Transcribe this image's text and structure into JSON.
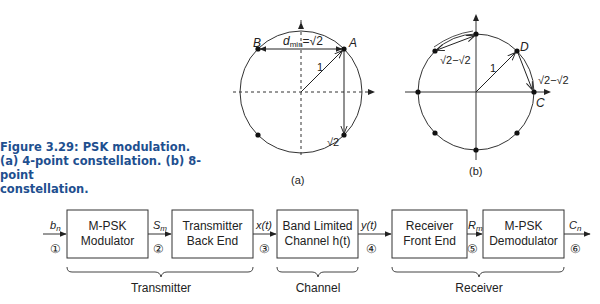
{
  "caption": {
    "line1": "Figure 3.29:  PSK modulation.",
    "line2": "(a) 4-point constellation. (b) 8-point",
    "line3": "constellation."
  },
  "constellation_a": {
    "label": "(a)",
    "points": [
      "A",
      "B"
    ],
    "dmin_label": "d",
    "dmin_sub": "min",
    "dmin_value": "=√2",
    "radius_label": "1",
    "vertical_distance_label": "√2"
  },
  "constellation_b": {
    "label": "(b)",
    "points": [
      "C",
      "D"
    ],
    "radius_label": "1",
    "distance_label_upper": "√2−√2",
    "distance_label_right": "√2−√2"
  },
  "block_diagram": {
    "blocks": [
      {
        "line1": "M-PSK",
        "line2": "Modulator"
      },
      {
        "line1": "Transmitter",
        "line2": "Back End"
      },
      {
        "line1": "Band Limited",
        "line2": "Channel h(t)"
      },
      {
        "line1": "Receiver",
        "line2": "Front End"
      },
      {
        "line1": "M-PSK",
        "line2": "Demodulator"
      }
    ],
    "signals": [
      {
        "name": "b",
        "sub": "n"
      },
      {
        "name": "S",
        "sub": "m"
      },
      {
        "name": "x(t)",
        "sub": ""
      },
      {
        "name": "y(t)",
        "sub": ""
      },
      {
        "name": "R",
        "sub": "m"
      },
      {
        "name": "C",
        "sub": "n"
      }
    ],
    "nodes": [
      "①",
      "②",
      "③",
      "④",
      "⑤",
      "⑥"
    ],
    "groups": [
      "Transmitter",
      "Channel",
      "Receiver"
    ]
  }
}
